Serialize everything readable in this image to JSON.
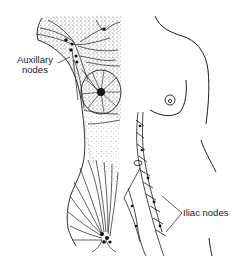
{
  "figure": {
    "labels": {
      "axillary_line1": "Auxillary",
      "axillary_line2": "nodes",
      "iliac": "Iliac nodes"
    },
    "colors": {
      "ink": "#1a1a1a",
      "background": "#ffffff",
      "stipple": "#555555"
    }
  }
}
